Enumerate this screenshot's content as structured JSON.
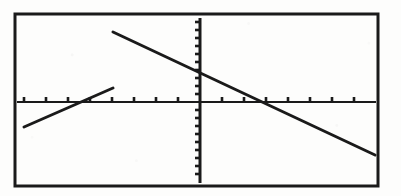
{
  "figure": {
    "title": "",
    "caption": "",
    "background_color": "#fdfdfc",
    "ink_color": "#1a1a1a",
    "style_note": "scanned graphing calculator screen"
  },
  "frame": {
    "label": "calculator-screen-border",
    "x": 15,
    "y": 14,
    "width": 363,
    "height": 172,
    "stroke_width": 3,
    "color": "#1a1a1a"
  },
  "axes": {
    "x_axis": {
      "label": "",
      "pixel_y": 102,
      "x_start": 17,
      "x_end": 376,
      "tick_count": 17,
      "tick_spacing_px": 22,
      "tick_length_px": 5,
      "stroke_width": 2
    },
    "y_axis": {
      "label": "",
      "pixel_x": 200,
      "y_start": 18,
      "y_end": 183,
      "tick_count": 21,
      "tick_spacing_px": 8,
      "tick_length_px": 5,
      "stroke_width": 3
    },
    "origin": {
      "x": 200,
      "y": 102
    },
    "grid": "off",
    "legend": "none",
    "axis_tick_labels": []
  },
  "chart_data": {
    "type": "line",
    "title": "",
    "xlabel": "",
    "ylabel": "",
    "grid": false,
    "legend_position": "none",
    "xlim": [
      -8.5,
      8.0
    ],
    "ylim": [
      -10.5,
      10.5
    ],
    "x_unit_px": 22,
    "y_unit_px": 8,
    "series": [
      {
        "name": "decreasing-line",
        "description": "long line with negative slope crossing both axes",
        "style": "solid",
        "color": "#1a1a1a",
        "x": [
          -3.95,
          3.18
        ],
        "y": [
          8.75,
          -6.63
        ],
        "slope": -2.16,
        "y_intercept": 3.63,
        "x_intercept": 3.18,
        "pixel_points": [
          [
            113,
            32
          ],
          [
            375,
            155
          ]
        ]
      },
      {
        "name": "increasing-segment",
        "description": "short line segment with positive slope, lower left to upper right",
        "style": "solid",
        "color": "#1a1a1a",
        "x": [
          -8.0,
          -3.95
        ],
        "y": [
          -3.13,
          1.75
        ],
        "slope": 1.21,
        "y_intercept": 6.53,
        "x_intercept": -5.45,
        "pixel_points": [
          [
            24,
            127
          ],
          [
            113,
            88
          ]
        ]
      }
    ],
    "intersection": {
      "visible": true,
      "x": -3.95,
      "y": 1.75,
      "pixel": [
        113,
        88
      ]
    },
    "annotations": []
  }
}
